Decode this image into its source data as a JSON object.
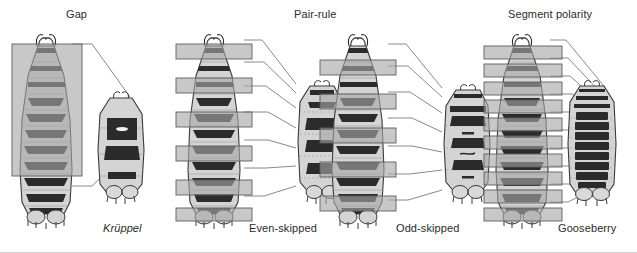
{
  "figure": {
    "type": "diagram",
    "background_color": "#ffffff",
    "palette": {
      "body_fill": "#d4d4d4",
      "body_outline": "#3a3a3a",
      "denticle_band": "#2b2b2b",
      "expression_overlay": "#a6a6a6",
      "overlay_outline": "#5d5d5d",
      "leader_line": "#6b6b6b",
      "text": "#2b2b2b"
    }
  },
  "groups": [
    {
      "id": "gap",
      "title": "Gap",
      "title_x": 66,
      "title_y": 8,
      "wildtype": {
        "name": "gap-wildtype-larva",
        "x": 8,
        "y": 30,
        "w": 78,
        "h": 196,
        "segments": 11,
        "overlay_style": "single-broad-block",
        "overlays": [
          {
            "x": 2,
            "y": 18,
            "w": 70,
            "h": 130
          }
        ]
      },
      "mutant": {
        "name": "kruppel-mutant-larva",
        "label": "Krüppel",
        "label_italic": true,
        "label_x": 103,
        "label_y": 225,
        "x": 92,
        "y": 88,
        "w": 52,
        "h": 116,
        "segments": 4,
        "description": "central thoracic and abdominal segments deleted; larva greatly shortened"
      },
      "leaders": [
        {
          "x1": 78,
          "y1": 44,
          "x2": 130,
          "y2": 97
        },
        {
          "x1": 78,
          "y1": 186,
          "x2": 130,
          "y2": 150
        }
      ]
    },
    {
      "id": "pair-rule-even",
      "title": "Pair-rule",
      "title_x": 294,
      "title_y": 8,
      "wildtype": {
        "name": "even-skipped-wildtype-larva",
        "x": 176,
        "y": 30,
        "w": 72,
        "h": 196,
        "segments": 11,
        "overlay_style": "alternating-stripes-even",
        "overlays": [
          {
            "x": -10,
            "y": 20,
            "w": 86,
            "h": 15
          },
          {
            "x": -10,
            "y": 55,
            "w": 86,
            "h": 15
          },
          {
            "x": -10,
            "y": 90,
            "w": 86,
            "h": 15
          },
          {
            "x": -10,
            "y": 125,
            "w": 86,
            "h": 15
          },
          {
            "x": -10,
            "y": 160,
            "w": 86,
            "h": 15
          }
        ]
      },
      "mutant": {
        "name": "even-skipped-mutant-larva",
        "label": "Even-skipped",
        "label_italic": false,
        "label_x": 249,
        "label_y": 225,
        "x": 258,
        "y": 78,
        "w": 52,
        "h": 128,
        "segments": 5,
        "description": "alternate segments deleted; half the normal number of denticle bands"
      },
      "leaders": [
        {
          "x1": 242,
          "y1": 40,
          "x2": 294,
          "y2": 84
        },
        {
          "x1": 242,
          "y1": 66,
          "x2": 294,
          "y2": 93
        },
        {
          "x1": 242,
          "y1": 92,
          "x2": 294,
          "y2": 110
        },
        {
          "x1": 242,
          "y1": 120,
          "x2": 294,
          "y2": 133
        },
        {
          "x1": 242,
          "y1": 150,
          "x2": 294,
          "y2": 156
        },
        {
          "x1": 242,
          "y1": 178,
          "x2": 294,
          "y2": 175
        },
        {
          "x1": 242,
          "y1": 200,
          "x2": 294,
          "y2": 192
        }
      ]
    },
    {
      "id": "pair-rule-odd",
      "title": "",
      "title_x": 0,
      "title_y": 0,
      "wildtype": {
        "name": "odd-skipped-wildtype-larva",
        "x": 320,
        "y": 30,
        "w": 72,
        "h": 196,
        "segments": 11,
        "overlay_style": "alternating-stripes-odd",
        "overlays": [
          {
            "x": -10,
            "y": 38,
            "w": 86,
            "h": 15
          },
          {
            "x": -10,
            "y": 73,
            "w": 86,
            "h": 15
          },
          {
            "x": -10,
            "y": 108,
            "w": 86,
            "h": 15
          },
          {
            "x": -10,
            "y": 143,
            "w": 86,
            "h": 15
          },
          {
            "x": -10,
            "y": 178,
            "w": 86,
            "h": 15
          }
        ]
      },
      "mutant": {
        "name": "odd-skipped-mutant-larva",
        "label": "Odd-skipped",
        "label_italic": false,
        "label_x": 396,
        "label_y": 225,
        "x": 404,
        "y": 82,
        "w": 52,
        "h": 124,
        "segments": 5,
        "description": "the complementary set of alternate segments deleted"
      },
      "leaders": [
        {
          "x1": 386,
          "y1": 42,
          "x2": 440,
          "y2": 86
        },
        {
          "x1": 386,
          "y1": 68,
          "x2": 440,
          "y2": 96
        },
        {
          "x1": 386,
          "y1": 96,
          "x2": 440,
          "y2": 116
        },
        {
          "x1": 386,
          "y1": 124,
          "x2": 440,
          "y2": 138
        },
        {
          "x1": 386,
          "y1": 152,
          "x2": 440,
          "y2": 158
        },
        {
          "x1": 386,
          "y1": 180,
          "x2": 440,
          "y2": 178
        },
        {
          "x1": 386,
          "y1": 202,
          "x2": 440,
          "y2": 196
        }
      ]
    },
    {
      "id": "segment-polarity",
      "title": "Segment polarity",
      "title_x": 508,
      "title_y": 8,
      "wildtype": {
        "name": "gooseberry-wildtype-larva",
        "x": 484,
        "y": 30,
        "w": 72,
        "h": 196,
        "segments": 11,
        "overlay_style": "every-segment-stripes",
        "overlays": [
          {
            "x": -12,
            "y": 20,
            "w": 90,
            "h": 13
          },
          {
            "x": -12,
            "y": 38,
            "w": 90,
            "h": 13
          },
          {
            "x": -12,
            "y": 56,
            "w": 90,
            "h": 13
          },
          {
            "x": -12,
            "y": 74,
            "w": 90,
            "h": 13
          },
          {
            "x": -12,
            "y": 92,
            "w": 90,
            "h": 13
          },
          {
            "x": -12,
            "y": 110,
            "w": 90,
            "h": 13
          },
          {
            "x": -12,
            "y": 128,
            "w": 90,
            "h": 13
          },
          {
            "x": -12,
            "y": 146,
            "w": 90,
            "h": 13
          },
          {
            "x": -12,
            "y": 164,
            "w": 90,
            "h": 13
          },
          {
            "x": -12,
            "y": 182,
            "w": 90,
            "h": 13
          }
        ]
      },
      "mutant": {
        "name": "gooseberry-mutant-larva",
        "label": "Gooseberry",
        "label_italic": false,
        "label_x": 558,
        "label_y": 225,
        "x": 562,
        "y": 80,
        "w": 56,
        "h": 130,
        "segments": 9,
        "description": "posterior part of every segment replaced by mirror-image duplicate of the anterior part; dense continuous denticle bands"
      },
      "leaders": [
        {
          "x1": 548,
          "y1": 40,
          "x2": 600,
          "y2": 84
        },
        {
          "x1": 548,
          "y1": 58,
          "x2": 600,
          "y2": 95
        },
        {
          "x1": 548,
          "y1": 76,
          "x2": 600,
          "y2": 106
        },
        {
          "x1": 548,
          "y1": 94,
          "x2": 600,
          "y2": 118
        },
        {
          "x1": 548,
          "y1": 112,
          "x2": 600,
          "y2": 130
        },
        {
          "x1": 548,
          "y1": 130,
          "x2": 600,
          "y2": 142
        },
        {
          "x1": 548,
          "y1": 148,
          "x2": 600,
          "y2": 154
        },
        {
          "x1": 548,
          "y1": 166,
          "x2": 600,
          "y2": 166
        },
        {
          "x1": 548,
          "y1": 184,
          "x2": 600,
          "y2": 178
        },
        {
          "x1": 548,
          "y1": 200,
          "x2": 600,
          "y2": 190
        }
      ]
    }
  ]
}
